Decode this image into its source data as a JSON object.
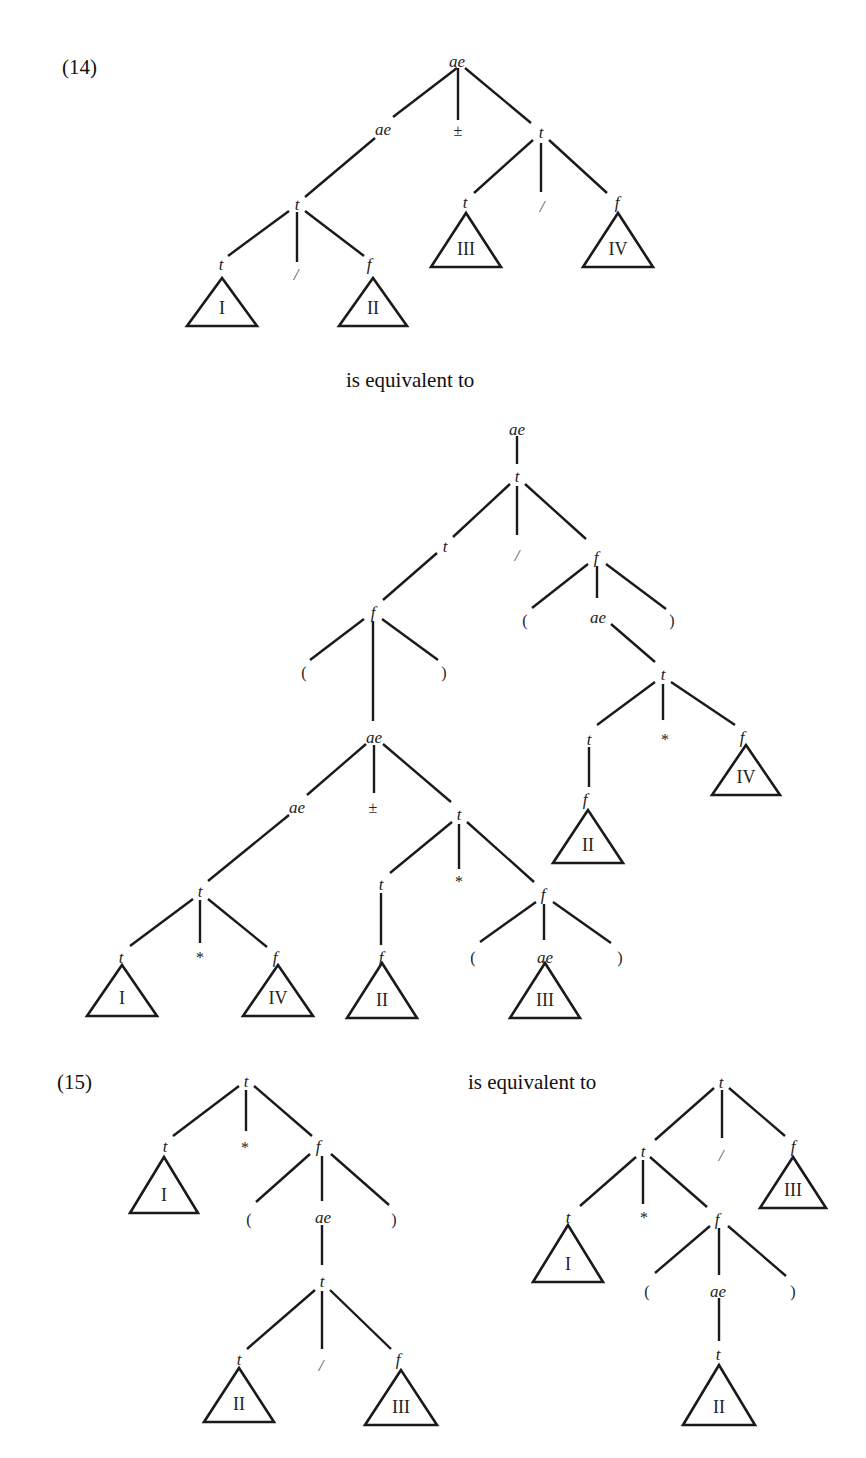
{
  "captions": [
    {
      "id": "ex14",
      "text": "(14)",
      "x": 62,
      "y": 74
    },
    {
      "id": "equiv1",
      "text": "is equivalent to",
      "x": 346,
      "y": 387
    },
    {
      "id": "ex15",
      "text": "(15)",
      "x": 57,
      "y": 1089
    },
    {
      "id": "equiv2",
      "text": "is equivalent to",
      "x": 468,
      "y": 1089
    }
  ],
  "trees": [
    {
      "id": "tree-14-left",
      "nodes": [
        {
          "id": "a0",
          "label": "ae",
          "kind": "node",
          "x": 457,
          "y": 62
        },
        {
          "id": "a1",
          "label": "ae",
          "kind": "node",
          "x": 383,
          "y": 130
        },
        {
          "id": "a2",
          "label": "±",
          "kind": "op",
          "x": 458,
          "y": 131
        },
        {
          "id": "a3",
          "label": "t",
          "kind": "node",
          "x": 541,
          "y": 133
        },
        {
          "id": "a4",
          "label": "t",
          "kind": "node",
          "x": 297,
          "y": 205
        },
        {
          "id": "a5",
          "label": "t",
          "kind": "node",
          "x": 221,
          "y": 265
        },
        {
          "id": "a6",
          "label": "/",
          "kind": "slash",
          "x": 296,
          "y": 275
        },
        {
          "id": "a7",
          "label": "f",
          "kind": "node",
          "x": 369,
          "y": 265
        },
        {
          "id": "a8",
          "label": "t",
          "kind": "node",
          "x": 465,
          "y": 203
        },
        {
          "id": "a9",
          "label": "/",
          "kind": "slash",
          "x": 542,
          "y": 207
        },
        {
          "id": "a10",
          "label": "f",
          "kind": "node",
          "x": 617,
          "y": 203
        }
      ],
      "edges": [
        [
          457,
          68,
          393,
          117
        ],
        [
          458,
          68,
          458,
          120
        ],
        [
          465,
          68,
          531,
          123
        ],
        [
          375,
          138,
          305,
          197
        ],
        [
          289,
          211,
          228,
          256
        ],
        [
          297,
          212,
          297,
          262
        ],
        [
          305,
          211,
          364,
          256
        ],
        [
          533,
          140,
          474,
          193
        ],
        [
          541,
          143,
          541,
          192
        ],
        [
          549,
          140,
          607,
          193
        ]
      ],
      "triangles": [
        {
          "label": "I",
          "cx": 222,
          "top": 278,
          "base": 326,
          "half": 35
        },
        {
          "label": "II",
          "cx": 373,
          "top": 278,
          "base": 326,
          "half": 34
        },
        {
          "label": "III",
          "cx": 466,
          "top": 213,
          "base": 267,
          "half": 35
        },
        {
          "label": "IV",
          "cx": 618,
          "top": 213,
          "base": 267,
          "half": 35
        }
      ]
    },
    {
      "id": "tree-14-right",
      "nodes": [
        {
          "id": "b0",
          "label": "ae",
          "kind": "node",
          "x": 517,
          "y": 430
        },
        {
          "id": "b1",
          "label": "t",
          "kind": "node",
          "x": 517,
          "y": 477
        },
        {
          "id": "b2",
          "label": "t",
          "kind": "node",
          "x": 445,
          "y": 547
        },
        {
          "id": "b3",
          "label": "/",
          "kind": "slash",
          "x": 517,
          "y": 556
        },
        {
          "id": "b4",
          "label": "f",
          "kind": "node",
          "x": 596,
          "y": 558
        },
        {
          "id": "b5",
          "label": "(",
          "kind": "op",
          "x": 525,
          "y": 621
        },
        {
          "id": "b6",
          "label": "ae",
          "kind": "node",
          "x": 598,
          "y": 618
        },
        {
          "id": "b7",
          "label": ")",
          "kind": "op",
          "x": 672,
          "y": 621
        },
        {
          "id": "b8",
          "label": "t",
          "kind": "node",
          "x": 663,
          "y": 675
        },
        {
          "id": "b9",
          "label": "t",
          "kind": "node",
          "x": 589,
          "y": 740
        },
        {
          "id": "b10",
          "label": "*",
          "kind": "op",
          "x": 665,
          "y": 740
        },
        {
          "id": "b11",
          "label": "f",
          "kind": "node",
          "x": 742,
          "y": 738
        },
        {
          "id": "b12",
          "label": "f",
          "kind": "node",
          "x": 585,
          "y": 800
        },
        {
          "id": "b13",
          "label": "f",
          "kind": "node",
          "x": 373,
          "y": 613
        },
        {
          "id": "b14",
          "label": "(",
          "kind": "op",
          "x": 304,
          "y": 673
        },
        {
          "id": "b15",
          "label": ")",
          "kind": "op",
          "x": 444,
          "y": 673
        },
        {
          "id": "b16",
          "label": "ae",
          "kind": "node",
          "x": 374,
          "y": 738
        },
        {
          "id": "b17",
          "label": "ae",
          "kind": "node",
          "x": 297,
          "y": 808
        },
        {
          "id": "b18",
          "label": "±",
          "kind": "op",
          "x": 373,
          "y": 808
        },
        {
          "id": "b19",
          "label": "t",
          "kind": "node",
          "x": 459,
          "y": 815
        },
        {
          "id": "b20",
          "label": "t",
          "kind": "node",
          "x": 200,
          "y": 892
        },
        {
          "id": "b21",
          "label": "t",
          "kind": "node",
          "x": 121,
          "y": 958
        },
        {
          "id": "b22",
          "label": "*",
          "kind": "op",
          "x": 200,
          "y": 958
        },
        {
          "id": "b23",
          "label": "f",
          "kind": "node",
          "x": 275,
          "y": 958
        },
        {
          "id": "b24",
          "label": "t",
          "kind": "node",
          "x": 381,
          "y": 885
        },
        {
          "id": "b25",
          "label": "*",
          "kind": "op",
          "x": 459,
          "y": 882
        },
        {
          "id": "b26",
          "label": "f",
          "kind": "node",
          "x": 543,
          "y": 895
        },
        {
          "id": "b27",
          "label": "f",
          "kind": "node",
          "x": 381,
          "y": 958
        },
        {
          "id": "b28",
          "label": "(",
          "kind": "op",
          "x": 473,
          "y": 958
        },
        {
          "id": "b29",
          "label": "ae",
          "kind": "node",
          "x": 545,
          "y": 958
        },
        {
          "id": "b30",
          "label": ")",
          "kind": "op",
          "x": 620,
          "y": 958
        }
      ],
      "edges": [
        [
          517,
          436,
          517,
          464
        ],
        [
          510,
          484,
          453,
          537
        ],
        [
          517,
          486,
          517,
          535
        ],
        [
          525,
          484,
          586,
          539
        ],
        [
          437,
          553,
          383,
          600
        ],
        [
          588,
          564,
          532,
          608
        ],
        [
          597,
          566,
          597,
          598
        ],
        [
          606,
          564,
          666,
          609
        ],
        [
          611,
          624,
          655,
          662
        ],
        [
          655,
          682,
          597,
          725
        ],
        [
          663,
          684,
          663,
          720
        ],
        [
          671,
          682,
          735,
          725
        ],
        [
          589,
          747,
          589,
          787
        ],
        [
          364,
          619,
          310,
          660
        ],
        [
          373,
          621,
          373,
          721
        ],
        [
          382,
          619,
          438,
          660
        ],
        [
          366,
          744,
          307,
          795
        ],
        [
          374,
          745,
          374,
          793
        ],
        [
          383,
          744,
          451,
          802
        ],
        [
          289,
          815,
          208,
          881
        ],
        [
          193,
          899,
          130,
          946
        ],
        [
          200,
          900,
          200,
          943
        ],
        [
          208,
          899,
          267,
          947
        ],
        [
          452,
          822,
          390,
          873
        ],
        [
          459,
          824,
          459,
          869
        ],
        [
          467,
          822,
          534,
          882
        ],
        [
          381,
          893,
          381,
          945
        ],
        [
          536,
          902,
          480,
          942
        ],
        [
          544,
          904,
          544,
          940
        ],
        [
          553,
          902,
          611,
          943
        ]
      ],
      "triangles": [
        {
          "label": "IV",
          "cx": 746,
          "top": 745,
          "base": 795,
          "half": 34
        },
        {
          "label": "II",
          "cx": 588,
          "top": 810,
          "base": 863,
          "half": 35
        },
        {
          "label": "I",
          "cx": 122,
          "top": 965,
          "base": 1016,
          "half": 35
        },
        {
          "label": "IV",
          "cx": 278,
          "top": 965,
          "base": 1016,
          "half": 35
        },
        {
          "label": "II",
          "cx": 382,
          "top": 963,
          "base": 1018,
          "half": 35
        },
        {
          "label": "III",
          "cx": 545,
          "top": 963,
          "base": 1018,
          "half": 35
        }
      ]
    },
    {
      "id": "tree-15-left",
      "nodes": [
        {
          "id": "c0",
          "label": "t",
          "kind": "node",
          "x": 246,
          "y": 1082
        },
        {
          "id": "c1",
          "label": "t",
          "kind": "node",
          "x": 165,
          "y": 1147
        },
        {
          "id": "c2",
          "label": "*",
          "kind": "op",
          "x": 245,
          "y": 1148
        },
        {
          "id": "c3",
          "label": "f",
          "kind": "node",
          "x": 318,
          "y": 1147
        },
        {
          "id": "c4",
          "label": "(",
          "kind": "op",
          "x": 249,
          "y": 1220
        },
        {
          "id": "c5",
          "label": "ae",
          "kind": "node",
          "x": 323,
          "y": 1218
        },
        {
          "id": "c6",
          "label": ")",
          "kind": "op",
          "x": 394,
          "y": 1220
        },
        {
          "id": "c7",
          "label": "t",
          "kind": "node",
          "x": 322,
          "y": 1282
        },
        {
          "id": "c8",
          "label": "t",
          "kind": "node",
          "x": 239,
          "y": 1360
        },
        {
          "id": "c9",
          "label": "/",
          "kind": "slash",
          "x": 321,
          "y": 1366
        },
        {
          "id": "c10",
          "label": "f",
          "kind": "node",
          "x": 398,
          "y": 1360
        }
      ],
      "edges": [
        [
          239,
          1086,
          173,
          1136
        ],
        [
          246,
          1090,
          246,
          1131
        ],
        [
          254,
          1086,
          312,
          1136
        ],
        [
          310,
          1154,
          256,
          1202
        ],
        [
          322,
          1156,
          322,
          1201
        ],
        [
          331,
          1154,
          389,
          1205
        ],
        [
          322,
          1225,
          322,
          1265
        ],
        [
          315,
          1290,
          247,
          1349
        ],
        [
          322,
          1291,
          322,
          1349
        ],
        [
          330,
          1290,
          391,
          1349
        ]
      ],
      "triangles": [
        {
          "label": "I",
          "cx": 164,
          "top": 1157,
          "base": 1213,
          "half": 34
        },
        {
          "label": "II",
          "cx": 239,
          "top": 1368,
          "base": 1422,
          "half": 35
        },
        {
          "label": "III",
          "cx": 401,
          "top": 1370,
          "base": 1425,
          "half": 36
        }
      ]
    },
    {
      "id": "tree-15-right",
      "nodes": [
        {
          "id": "d0",
          "label": "t",
          "kind": "node",
          "x": 721,
          "y": 1083
        },
        {
          "id": "d1",
          "label": "t",
          "kind": "node",
          "x": 643,
          "y": 1152
        },
        {
          "id": "d2",
          "label": "/",
          "kind": "slash",
          "x": 721,
          "y": 1156
        },
        {
          "id": "d3",
          "label": "f",
          "kind": "node",
          "x": 793,
          "y": 1147
        },
        {
          "id": "d4",
          "label": "t",
          "kind": "node",
          "x": 568,
          "y": 1218
        },
        {
          "id": "d5",
          "label": "*",
          "kind": "op",
          "x": 644,
          "y": 1218
        },
        {
          "id": "d6",
          "label": "f",
          "kind": "node",
          "x": 717,
          "y": 1220
        },
        {
          "id": "d7",
          "label": "(",
          "kind": "op",
          "x": 647,
          "y": 1292
        },
        {
          "id": "d8",
          "label": "ae",
          "kind": "node",
          "x": 718,
          "y": 1292
        },
        {
          "id": "d9",
          "label": ")",
          "kind": "op",
          "x": 793,
          "y": 1292
        },
        {
          "id": "d10",
          "label": "t",
          "kind": "node",
          "x": 718,
          "y": 1355
        }
      ],
      "edges": [
        [
          714,
          1088,
          655,
          1140
        ],
        [
          722,
          1090,
          722,
          1138
        ],
        [
          729,
          1088,
          785,
          1136
        ],
        [
          636,
          1157,
          580,
          1206
        ],
        [
          643,
          1160,
          643,
          1204
        ],
        [
          650,
          1157,
          707,
          1207
        ],
        [
          710,
          1226,
          655,
          1273
        ],
        [
          719,
          1228,
          719,
          1275
        ],
        [
          728,
          1226,
          786,
          1276
        ],
        [
          719,
          1298,
          719,
          1341
        ]
      ],
      "triangles": [
        {
          "label": "III",
          "cx": 793,
          "top": 1157,
          "base": 1208,
          "half": 33
        },
        {
          "label": "I",
          "cx": 568,
          "top": 1225,
          "base": 1282,
          "half": 35
        },
        {
          "label": "II",
          "cx": 719,
          "top": 1365,
          "base": 1425,
          "half": 36
        }
      ]
    }
  ]
}
